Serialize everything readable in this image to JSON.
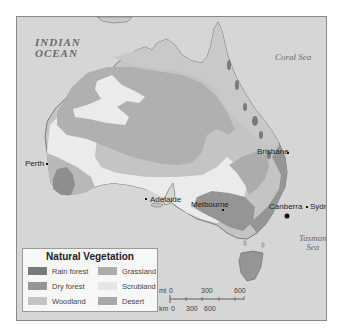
{
  "map": {
    "water_labels": {
      "indian_ocean_line1": "INDIAN",
      "indian_ocean_line2": "OCEAN",
      "coral_sea": "Coral Sea",
      "tasman_line1": "Tasman",
      "tasman_line2": "Sea"
    },
    "cities": [
      {
        "name": "Perth"
      },
      {
        "name": "Adelaide"
      },
      {
        "name": "Melbourne"
      },
      {
        "name": "Canberra",
        "capital": true
      },
      {
        "name": "Sydney"
      },
      {
        "name": "Brisbane"
      }
    ],
    "colors": {
      "water": "#d6d6d6",
      "rain_forest": "#7a7a7a",
      "dry_forest": "#959595",
      "woodland": "#c4c4c4",
      "grassland": "#acacac",
      "scrubland": "#ebebeb",
      "desert": "#b3b3b3"
    }
  },
  "legend": {
    "title": "Natural Vegetation",
    "items": [
      {
        "label": "Rain forest",
        "color": "#7a7a7a"
      },
      {
        "label": "Dry forest",
        "color": "#959595"
      },
      {
        "label": "Woodland",
        "color": "#c4c4c4"
      },
      {
        "label": "Grassland",
        "color": "#acacac"
      },
      {
        "label": "Scrubland",
        "color": "#e6e6e6"
      },
      {
        "label": "Desert",
        "color": "#a9a9a9"
      }
    ]
  },
  "scale": {
    "mi_label": "mi",
    "mi_ticks": [
      "0",
      "300",
      "600"
    ],
    "km_label": "km",
    "km_ticks": [
      "0",
      "300",
      "600"
    ]
  }
}
